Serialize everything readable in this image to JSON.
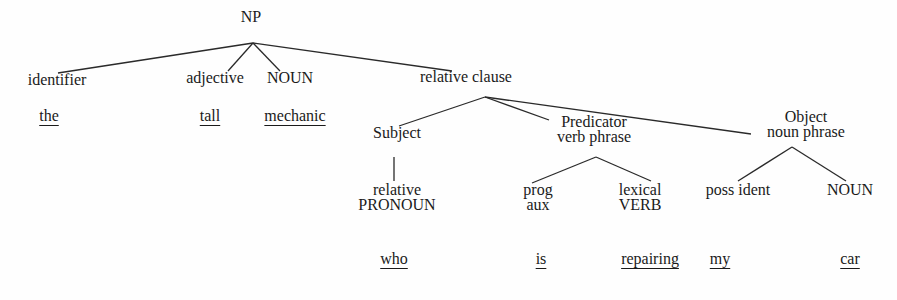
{
  "diagram": {
    "title": "NP",
    "nodes": [
      {
        "id": "np",
        "lines": [
          "NP"
        ],
        "x": 251,
        "y": 17
      },
      {
        "id": "identifier",
        "lines": [
          "identifier"
        ],
        "x": 57,
        "y": 80
      },
      {
        "id": "adjective",
        "lines": [
          "adjective"
        ],
        "x": 215,
        "y": 78
      },
      {
        "id": "noun1",
        "lines": [
          "NOUN"
        ],
        "x": 290,
        "y": 78
      },
      {
        "id": "relative-clause",
        "lines": [
          "relative clause"
        ],
        "x": 466,
        "y": 77
      },
      {
        "id": "subject",
        "lines": [
          "Subject"
        ],
        "x": 397,
        "y": 133
      },
      {
        "id": "predicator",
        "lines": [
          "Predicator",
          "verb phrase"
        ],
        "x": 594,
        "y": 122
      },
      {
        "id": "object",
        "lines": [
          "Object",
          "noun phrase"
        ],
        "x": 806,
        "y": 117
      },
      {
        "id": "relative-pronoun",
        "lines": [
          "relative",
          "PRONOUN"
        ],
        "x": 397,
        "y": 190
      },
      {
        "id": "prog-aux",
        "lines": [
          "prog",
          "aux"
        ],
        "x": 538,
        "y": 190
      },
      {
        "id": "lexical-verb",
        "lines": [
          "lexical",
          "VERB"
        ],
        "x": 640,
        "y": 190
      },
      {
        "id": "poss-ident",
        "lines": [
          "poss ident"
        ],
        "x": 738,
        "y": 190
      },
      {
        "id": "noun2",
        "lines": [
          "NOUN"
        ],
        "x": 850,
        "y": 190
      }
    ],
    "edges": [
      {
        "from": "np",
        "to": "identifier",
        "x1": 253,
        "y1": 43,
        "x2": 58,
        "y2": 73
      },
      {
        "from": "np",
        "to": "adjective",
        "x1": 253,
        "y1": 43,
        "x2": 228,
        "y2": 71
      },
      {
        "from": "np",
        "to": "noun1",
        "x1": 253,
        "y1": 43,
        "x2": 280,
        "y2": 71
      },
      {
        "from": "np",
        "to": "relative-clause",
        "x1": 253,
        "y1": 43,
        "x2": 452,
        "y2": 71
      },
      {
        "from": "relative-clause",
        "to": "subject",
        "x1": 485,
        "y1": 97,
        "x2": 399,
        "y2": 126
      },
      {
        "from": "relative-clause",
        "to": "predicator",
        "x1": 485,
        "y1": 97,
        "x2": 549,
        "y2": 120
      },
      {
        "from": "relative-clause",
        "to": "object",
        "x1": 485,
        "y1": 97,
        "x2": 751,
        "y2": 134
      },
      {
        "from": "subject",
        "to": "relative-pronoun",
        "x1": 394,
        "y1": 157,
        "x2": 394,
        "y2": 181
      },
      {
        "from": "predicator",
        "to": "prog-aux",
        "x1": 596,
        "y1": 157,
        "x2": 532,
        "y2": 183
      },
      {
        "from": "predicator",
        "to": "lexical-verb",
        "x1": 596,
        "y1": 157,
        "x2": 651,
        "y2": 181
      },
      {
        "from": "object",
        "to": "poss-ident",
        "x1": 792,
        "y1": 147,
        "x2": 738,
        "y2": 181
      },
      {
        "from": "object",
        "to": "noun2",
        "x1": 792,
        "y1": 147,
        "x2": 846,
        "y2": 181
      }
    ],
    "words": [
      {
        "id": "the",
        "text": "the",
        "x": 49,
        "y": 116
      },
      {
        "id": "tall",
        "text": "tall",
        "x": 210,
        "y": 116
      },
      {
        "id": "mechanic",
        "text": "mechanic",
        "x": 295,
        "y": 116
      },
      {
        "id": "who",
        "text": "who",
        "x": 394,
        "y": 259
      },
      {
        "id": "is",
        "text": "is",
        "x": 541,
        "y": 259
      },
      {
        "id": "repairing",
        "text": "repairing",
        "x": 650,
        "y": 259
      },
      {
        "id": "my",
        "text": "my",
        "x": 720,
        "y": 259
      },
      {
        "id": "car",
        "text": "car",
        "x": 850,
        "y": 259
      }
    ]
  }
}
